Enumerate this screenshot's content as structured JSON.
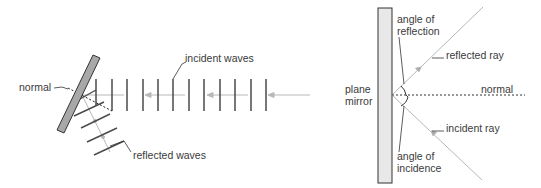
{
  "left_diagram": {
    "labels": {
      "normal": "normal",
      "incident_waves": "incident waves",
      "reflected_waves": "reflected waves"
    },
    "wavefront_x": [
      96,
      112,
      127,
      143,
      158,
      173,
      189,
      204,
      220,
      235,
      251,
      266
    ]
  },
  "right_diagram": {
    "labels": {
      "angle_of_reflection_1": "angle of",
      "angle_of_reflection_2": "reflection",
      "reflected_ray": "reflected ray",
      "plane_mirror_1": "plane",
      "plane_mirror_2": "mirror",
      "normal": "normal",
      "incident_ray": "incident ray",
      "angle_of_incidence_1": "angle of",
      "angle_of_incidence_2": "incidence"
    }
  },
  "colors": {
    "mirror_fill_left": "#a8a8a8",
    "mirror_fill_right": "#e6e6e6",
    "ray": "#b0b0b0",
    "line": "#3a3a3a"
  }
}
